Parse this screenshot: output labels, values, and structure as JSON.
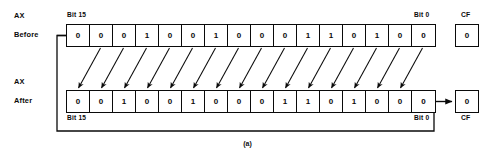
{
  "figure": {
    "caption": "(a)",
    "operation": "rotate-left-through-carry"
  },
  "rows": {
    "before": {
      "register_label": "AX",
      "state_label": "Before",
      "msb_label": "Bit 15",
      "lsb_label": "Bit 0",
      "bits": [
        "0",
        "0",
        "0",
        "1",
        "0",
        "0",
        "1",
        "0",
        "0",
        "0",
        "1",
        "1",
        "0",
        "1",
        "0",
        "0"
      ],
      "carry_flag_label": "CF",
      "carry_flag_value": "0"
    },
    "after": {
      "register_label": "AX",
      "state_label": "After",
      "msb_label": "Bit 15",
      "lsb_label": "Bit 0",
      "bits": [
        "0",
        "0",
        "1",
        "0",
        "0",
        "1",
        "0",
        "0",
        "0",
        "1",
        "1",
        "0",
        "1",
        "0",
        "0",
        "0"
      ],
      "carry_flag_label": "CF",
      "carry_flag_value": "0"
    }
  },
  "colors": {
    "ink": "#0a0a0a",
    "paper": "#ffffff"
  }
}
